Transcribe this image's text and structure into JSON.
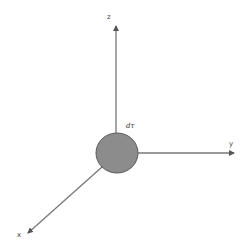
{
  "diagram": {
    "type": "3d-coordinate-axes",
    "axes": {
      "x": {
        "label": "x"
      },
      "y": {
        "label": "y"
      },
      "z": {
        "label": "z"
      }
    },
    "element": {
      "label": "dτ",
      "shape": "circle",
      "fill_color": "#8c8c8c",
      "stroke_color": "#5a5a5a"
    },
    "axis_color": "#666666"
  }
}
